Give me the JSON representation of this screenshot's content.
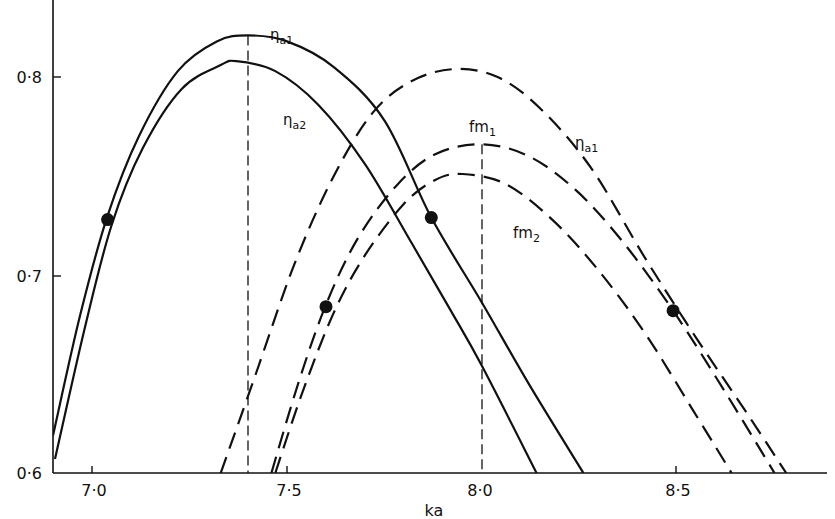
{
  "chart_data": {
    "type": "line",
    "title": "",
    "xlabel": "ka",
    "ylabel": "",
    "xlim": [
      6.9,
      8.9
    ],
    "ylim": [
      0.6,
      0.83
    ],
    "grid": false,
    "legend": "inline curve labels",
    "x_ticks": [
      7.0,
      7.5,
      8.0,
      8.5
    ],
    "x_tick_labels": [
      "7·0",
      "7·5",
      "8·0",
      "8·5"
    ],
    "y_ticks": [
      0.6,
      0.7,
      0.8
    ],
    "y_tick_labels": [
      "0·6",
      "0·7",
      "0·8"
    ],
    "series": [
      {
        "name": "ηa1 (solid)",
        "label": "η",
        "label_sub": "a1",
        "style": "solid",
        "x": [
          6.9,
          6.97,
          7.04,
          7.12,
          7.22,
          7.32,
          7.4,
          7.5,
          7.62,
          7.75,
          7.87,
          8.0,
          8.12,
          8.26
        ],
        "y": [
          0.619,
          0.68,
          0.73,
          0.77,
          0.803,
          0.818,
          0.821,
          0.818,
          0.805,
          0.778,
          0.729,
          0.686,
          0.645,
          0.6
        ]
      },
      {
        "name": "ηa2 (solid)",
        "label": "η",
        "label_sub": "a2",
        "style": "solid",
        "x": [
          6.905,
          6.98,
          7.05,
          7.13,
          7.23,
          7.33,
          7.37,
          7.47,
          7.58,
          7.7,
          7.82,
          7.92,
          8.0,
          8.14
        ],
        "y": [
          0.607,
          0.672,
          0.725,
          0.764,
          0.794,
          0.806,
          0.808,
          0.803,
          0.786,
          0.756,
          0.716,
          0.682,
          0.654,
          0.6
        ]
      },
      {
        "name": "ηa1 (dashed)",
        "label": "η",
        "label_sub": "a1",
        "style": "dashed",
        "x": [
          7.33,
          7.42,
          7.52,
          7.62,
          7.72,
          7.82,
          7.93,
          8.04,
          8.15,
          8.28,
          8.42,
          8.55,
          8.68,
          8.78
        ],
        "y": [
          0.6,
          0.65,
          0.706,
          0.75,
          0.782,
          0.798,
          0.804,
          0.8,
          0.784,
          0.754,
          0.708,
          0.668,
          0.63,
          0.6
        ]
      },
      {
        "name": "fm1 (dashed)",
        "label": "fm",
        "label_sub": "1",
        "style": "dashed",
        "x": [
          7.46,
          7.53,
          7.6,
          7.68,
          7.78,
          7.88,
          8.0,
          8.12,
          8.24,
          8.36,
          8.49,
          8.62,
          8.75
        ],
        "y": [
          0.6,
          0.646,
          0.685,
          0.718,
          0.745,
          0.761,
          0.766,
          0.76,
          0.743,
          0.717,
          0.682,
          0.642,
          0.6
        ]
      },
      {
        "name": "fm2 (dashed)",
        "label": "fm",
        "label_sub": "2",
        "style": "dashed",
        "x": [
          7.47,
          7.54,
          7.62,
          7.7,
          7.8,
          7.88,
          7.95,
          8.06,
          8.18,
          8.3,
          8.42,
          8.54,
          8.64
        ],
        "y": [
          0.6,
          0.641,
          0.681,
          0.71,
          0.736,
          0.748,
          0.751,
          0.746,
          0.728,
          0.702,
          0.67,
          0.632,
          0.6
        ]
      }
    ],
    "markers": [
      {
        "x": 7.04,
        "y": 0.728
      },
      {
        "x": 7.87,
        "y": 0.729
      },
      {
        "x": 7.6,
        "y": 0.684
      },
      {
        "x": 8.49,
        "y": 0.682
      }
    ],
    "reference_lines": [
      {
        "orientation": "vertical",
        "x": 7.4,
        "style": "dashed",
        "from_y": 0.6,
        "to_y": 0.821
      },
      {
        "orientation": "vertical",
        "x": 8.0,
        "style": "dashed",
        "from_y": 0.6,
        "to_y": 0.766
      }
    ],
    "annotations": [
      {
        "text": "η",
        "sub": "a1",
        "x": 7.45,
        "y": 0.822
      },
      {
        "text": "η",
        "sub": "a2",
        "x": 7.39,
        "y": 0.781
      },
      {
        "text": "fm",
        "sub": "1",
        "x": 7.97,
        "y": 0.776
      },
      {
        "text": "η",
        "sub": "a1",
        "x": 8.18,
        "y": 0.758
      },
      {
        "text": "fm",
        "sub": "2",
        "x": 8.12,
        "y": 0.717
      }
    ]
  },
  "axes": {
    "x_title": "ka",
    "x_tick_labels": [
      "7·0",
      "7·5",
      "8·0",
      "8·5"
    ],
    "y_tick_labels": [
      "0·6",
      "0·7",
      "0·8"
    ]
  },
  "labels": {
    "solid_eta_a1": "η",
    "solid_eta_a1_sub": "a1",
    "solid_eta_a2": "η",
    "solid_eta_a2_sub": "a2",
    "fm1": "fm",
    "fm1_sub": "1",
    "dashed_eta_a1": "η",
    "dashed_eta_a1_sub": "a1",
    "fm2": "fm",
    "fm2_sub": "2"
  },
  "colors": {
    "ink": "#111111",
    "background": "#ffffff"
  }
}
